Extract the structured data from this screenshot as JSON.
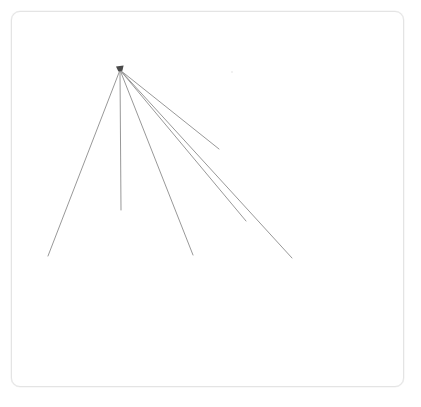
{
  "figure": {
    "background_color": "#ffffff"
  },
  "frame": {
    "name": "canvas-frame",
    "x": 11,
    "y": 11,
    "width": 393,
    "height": 376,
    "border_color": "#e4e4e4",
    "border_radius": 9,
    "fill_color": "#ffffff"
  },
  "chart_data": {
    "type": "line",
    "xlabel": "",
    "ylabel": "",
    "xlim": [
      0,
      421
    ],
    "ylim": [
      0,
      407
    ],
    "grid": false,
    "legend_position": "none",
    "origin": {
      "x": 120,
      "y": 70,
      "label": "convergence-point"
    },
    "stroke_color": "#8c8c8c",
    "stroke_width": 0.9,
    "series": [
      {
        "name": "ray-1-left",
        "x": [
          120,
          48
        ],
        "y": [
          70,
          256
        ],
        "length": 199,
        "angle_deg": 111
      },
      {
        "name": "ray-2-vertical",
        "x": [
          120,
          121
        ],
        "y": [
          70,
          210
        ],
        "length": 140,
        "angle_deg": 90
      },
      {
        "name": "ray-3-downright",
        "x": [
          120,
          193
        ],
        "y": [
          70,
          255
        ],
        "length": 199,
        "angle_deg": 68
      },
      {
        "name": "ray-4-upperright",
        "x": [
          120,
          219
        ],
        "y": [
          70,
          149
        ],
        "length": 127,
        "angle_deg": 39
      },
      {
        "name": "ray-5-midright",
        "x": [
          120,
          246
        ],
        "y": [
          70,
          221
        ],
        "length": 199,
        "angle_deg": 49
      },
      {
        "name": "ray-6-lowerright",
        "x": [
          120,
          292
        ],
        "y": [
          70,
          258
        ],
        "length": 254,
        "angle_deg": 48
      }
    ],
    "markers": [
      {
        "name": "apex-blob",
        "x": 120,
        "y": 70,
        "color": "#4a4a4a",
        "size": 4
      },
      {
        "name": "faint-speck",
        "x": 232,
        "y": 72,
        "color": "#ededed",
        "size": 2
      }
    ]
  }
}
